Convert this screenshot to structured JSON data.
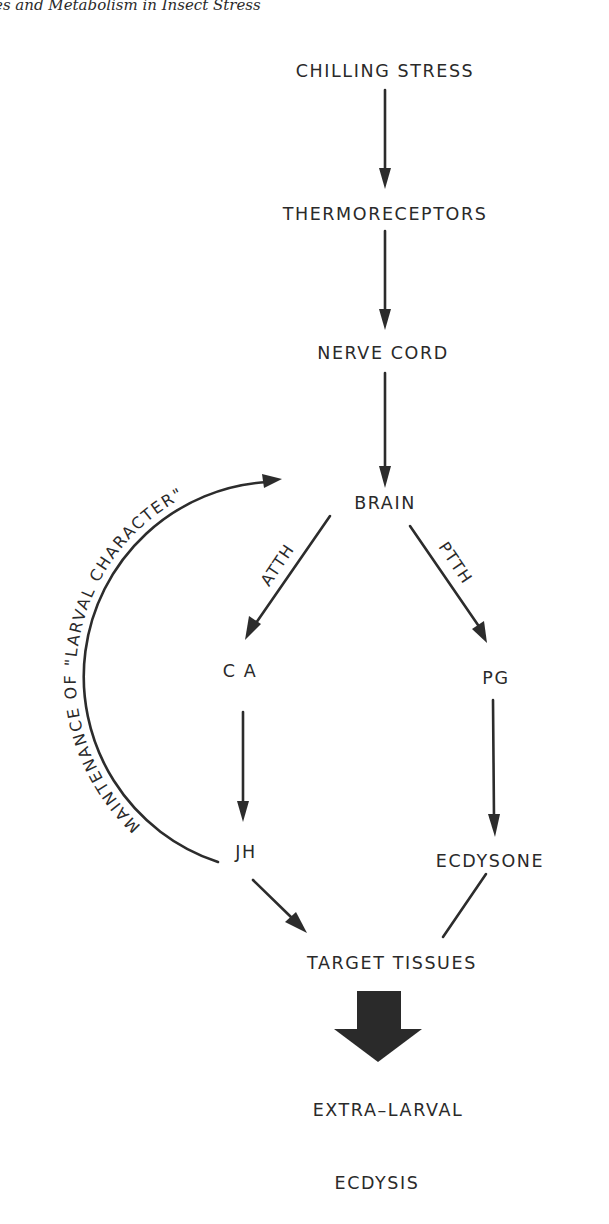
{
  "page": {
    "running_header": "es and Metabolism in Insect Stress"
  },
  "diagram": {
    "nodes": {
      "chilling_stress": "CHILLING STRESS",
      "thermoreceptors": "THERMORECEPTORS",
      "nerve_cord": "NERVE CORD",
      "brain": "BRAIN",
      "ca": "C A",
      "pg": "PG",
      "jh": "JH",
      "ecdysone": "ECDYSONE",
      "target_tissues": "TARGET TISSUES",
      "extra_larval": "EXTRA–LARVAL",
      "ecdysis": "ECDYSIS"
    },
    "edge_labels": {
      "atth": "ATTH",
      "ptth": "PTTH",
      "feedback": "MAINTENANCE OF \"LARVAL CHARACTER\""
    },
    "edges": [
      {
        "from": "CHILLING STRESS",
        "to": "THERMORECEPTORS",
        "arrow": true
      },
      {
        "from": "THERMORECEPTORS",
        "to": "NERVE CORD",
        "arrow": true
      },
      {
        "from": "NERVE CORD",
        "to": "BRAIN",
        "arrow": true
      },
      {
        "from": "BRAIN",
        "to": "CA",
        "label": "ATTH",
        "arrow": true
      },
      {
        "from": "BRAIN",
        "to": "PG",
        "label": "PTTH",
        "arrow": true
      },
      {
        "from": "CA",
        "to": "JH",
        "arrow": true
      },
      {
        "from": "PG",
        "to": "ECDYSONE",
        "arrow": true
      },
      {
        "from": "JH",
        "to": "TARGET TISSUES",
        "arrow": true
      },
      {
        "from": "ECDYSONE",
        "to": "TARGET TISSUES",
        "arrow": false
      },
      {
        "from": "JH",
        "to": "BRAIN",
        "label": "MAINTENANCE OF \"LARVAL CHARACTER\"",
        "arrow": true,
        "curved": true
      },
      {
        "from": "TARGET TISSUES",
        "to": "EXTRA-LARVAL ECDYSIS",
        "arrow": true,
        "style": "bold-block"
      }
    ]
  }
}
